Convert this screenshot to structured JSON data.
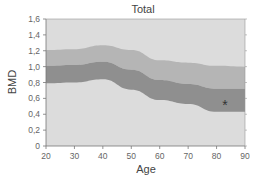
{
  "chart_data": {
    "type": "area",
    "title": "Total",
    "xlabel": "Age",
    "ylabel": "BMD",
    "xlim": [
      20,
      90
    ],
    "ylim": [
      0,
      1.6
    ],
    "xticks": [
      "20",
      "30",
      "40",
      "50",
      "60",
      "70",
      "80",
      "90"
    ],
    "yticks": [
      "0",
      "0,2",
      "0,4",
      "0,6",
      "0,8",
      "1,0",
      "1,2",
      "1,4",
      "1,6"
    ],
    "grid": false,
    "x": [
      20,
      30,
      40,
      50,
      60,
      70,
      80,
      90
    ],
    "series": [
      {
        "name": "upper band top (+2 SD)",
        "values": [
          1.21,
          1.22,
          1.27,
          1.21,
          1.08,
          1.05,
          1.01,
          1.0
        ]
      },
      {
        "name": "dark band top (+1 SD)",
        "values": [
          1.01,
          1.02,
          1.06,
          0.96,
          0.83,
          0.78,
          0.72,
          0.72
        ]
      },
      {
        "name": "dark band bottom (mean reference)",
        "values": [
          0.79,
          0.8,
          0.84,
          0.71,
          0.58,
          0.53,
          0.43,
          0.43
        ]
      }
    ],
    "bands": [
      {
        "name": "light-band",
        "from": "dark band top (+1 SD)",
        "to": "upper band top (+2 SD)",
        "color": "#b5b5b5"
      },
      {
        "name": "dark-band",
        "from": "dark band bottom (mean reference)",
        "to": "dark band top (+1 SD)",
        "color": "#8f8f8f"
      }
    ],
    "annotations": [
      {
        "text": "*",
        "x": 83,
        "y": 0.53
      }
    ],
    "colors": {
      "plot_background": "#dcdcdc",
      "light_band": "#b5b5b5",
      "dark_band": "#8f8f8f",
      "axis": "#777777"
    }
  }
}
